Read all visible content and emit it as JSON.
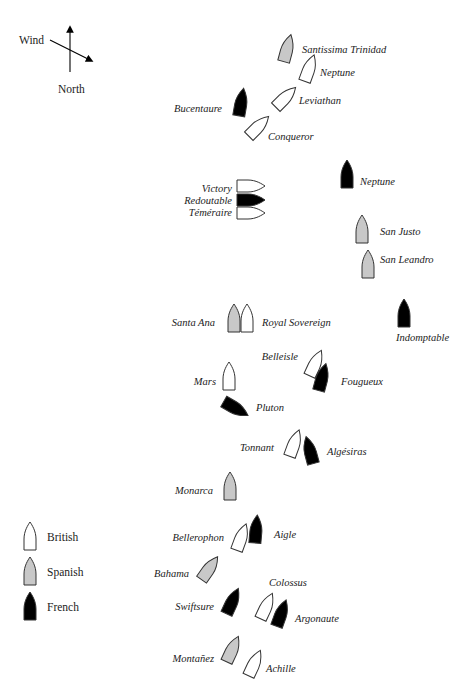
{
  "compass": {
    "wind_label": "Wind",
    "north_label": "North",
    "north_arrow": {
      "x": 70,
      "y1": 72,
      "y2": 29
    },
    "wind_arrow": {
      "x1": 50,
      "y1": 40,
      "x2": 90,
      "y2": 60
    }
  },
  "colors": {
    "British": "#ffffff",
    "Spanish": "#c8c8c8",
    "French": "#000000",
    "outline": "#333333"
  },
  "legend": [
    {
      "label": "British",
      "nation": "British",
      "x": 30,
      "y": 537
    },
    {
      "label": "Spanish",
      "nation": "Spanish",
      "x": 30,
      "y": 572
    },
    {
      "label": "French",
      "nation": "French",
      "x": 30,
      "y": 607
    }
  ],
  "ships": [
    {
      "name": "Santissima Trinidad",
      "nation": "Spanish",
      "x": 287,
      "y": 49,
      "rot": 15,
      "label_x": 302,
      "label_y": 53,
      "anchor": "start"
    },
    {
      "name": "Neptune",
      "nation": "British",
      "x": 309,
      "y": 69,
      "rot": 20,
      "label_x": 320,
      "label_y": 76,
      "anchor": "start"
    },
    {
      "name": "Leviathan",
      "nation": "British",
      "x": 285,
      "y": 98,
      "rot": 45,
      "label_x": 299,
      "label_y": 104,
      "anchor": "start"
    },
    {
      "name": "Bucentaure",
      "nation": "French",
      "x": 241,
      "y": 103,
      "rot": 10,
      "label_x": 222,
      "label_y": 112,
      "anchor": "end"
    },
    {
      "name": "Conqueror",
      "nation": "British",
      "x": 258,
      "y": 127,
      "rot": 45,
      "label_x": 268,
      "label_y": 140,
      "anchor": "start"
    },
    {
      "name": "Neptune",
      "nation": "French",
      "x": 347,
      "y": 175,
      "rot": 0,
      "label_x": 360,
      "label_y": 185,
      "anchor": "start"
    },
    {
      "name": "Victory",
      "nation": "British",
      "x": 250,
      "y": 186,
      "rot": 90,
      "label_x": 232,
      "label_y": 192,
      "anchor": "end"
    },
    {
      "name": "Redoutable",
      "nation": "French",
      "x": 250,
      "y": 200,
      "rot": 90,
      "label_x": 232,
      "label_y": 204,
      "anchor": "end"
    },
    {
      "name": "Téméraire",
      "nation": "British",
      "x": 250,
      "y": 213,
      "rot": 90,
      "label_x": 232,
      "label_y": 216,
      "anchor": "end"
    },
    {
      "name": "San Justo",
      "nation": "Spanish",
      "x": 362,
      "y": 230,
      "rot": 0,
      "label_x": 380,
      "label_y": 235,
      "anchor": "start"
    },
    {
      "name": "San Leandro",
      "nation": "Spanish",
      "x": 368,
      "y": 265,
      "rot": 0,
      "label_x": 380,
      "label_y": 263,
      "anchor": "start"
    },
    {
      "name": "Indomptable",
      "nation": "French",
      "x": 404,
      "y": 314,
      "rot": 0,
      "label_x": 396,
      "label_y": 341,
      "anchor": "start"
    },
    {
      "name": "Santa Ana",
      "nation": "Spanish",
      "x": 234,
      "y": 319,
      "rot": 0,
      "label_x": 215,
      "label_y": 326,
      "anchor": "end"
    },
    {
      "name": "Royal Sovereign",
      "nation": "British",
      "x": 247,
      "y": 319,
      "rot": 0,
      "label_x": 262,
      "label_y": 326,
      "anchor": "start"
    },
    {
      "name": "Belleisle",
      "nation": "British",
      "x": 315,
      "y": 364,
      "rot": 25,
      "label_x": 298,
      "label_y": 360,
      "anchor": "end"
    },
    {
      "name": "Fougueux",
      "nation": "French",
      "x": 322,
      "y": 378,
      "rot": 15,
      "label_x": 341,
      "label_y": 385,
      "anchor": "start"
    },
    {
      "name": "Mars",
      "nation": "British",
      "x": 229,
      "y": 377,
      "rot": 0,
      "label_x": 216,
      "label_y": 385,
      "anchor": "end"
    },
    {
      "name": "Pluton",
      "nation": "French",
      "x": 235,
      "y": 408,
      "rot": 120,
      "label_x": 256,
      "label_y": 411,
      "anchor": "start"
    },
    {
      "name": "Tonnant",
      "nation": "British",
      "x": 294,
      "y": 444,
      "rot": 20,
      "label_x": 274,
      "label_y": 451,
      "anchor": "end"
    },
    {
      "name": "Algésiras",
      "nation": "French",
      "x": 310,
      "y": 451,
      "rot": -15,
      "label_x": 327,
      "label_y": 455,
      "anchor": "start"
    },
    {
      "name": "Monarca",
      "nation": "Spanish",
      "x": 230,
      "y": 487,
      "rot": 0,
      "label_x": 213,
      "label_y": 494,
      "anchor": "end"
    },
    {
      "name": "Bellerophon",
      "nation": "British",
      "x": 241,
      "y": 538,
      "rot": 20,
      "label_x": 224,
      "label_y": 541,
      "anchor": "end"
    },
    {
      "name": "Aigle",
      "nation": "French",
      "x": 256,
      "y": 530,
      "rot": 5,
      "label_x": 274,
      "label_y": 538,
      "anchor": "start"
    },
    {
      "name": "Bahama",
      "nation": "Spanish",
      "x": 209,
      "y": 569,
      "rot": 35,
      "label_x": 189,
      "label_y": 577,
      "anchor": "end"
    },
    {
      "name": "Swiftsure",
      "nation": "French",
      "x": 232,
      "y": 602,
      "rot": 25,
      "label_x": 214,
      "label_y": 610,
      "anchor": "end"
    },
    {
      "name": "Colossus",
      "nation": "British",
      "x": 266,
      "y": 607,
      "rot": 25,
      "label_x": 269,
      "label_y": 586,
      "anchor": "start"
    },
    {
      "name": "Argonaute",
      "nation": "French",
      "x": 281,
      "y": 614,
      "rot": 20,
      "label_x": 295,
      "label_y": 622,
      "anchor": "start"
    },
    {
      "name": "Montañez",
      "nation": "Spanish",
      "x": 232,
      "y": 650,
      "rot": 25,
      "label_x": 214,
      "label_y": 662,
      "anchor": "end"
    },
    {
      "name": "Achille",
      "nation": "British",
      "x": 254,
      "y": 664,
      "rot": 25,
      "label_x": 266,
      "label_y": 672,
      "anchor": "start"
    }
  ]
}
